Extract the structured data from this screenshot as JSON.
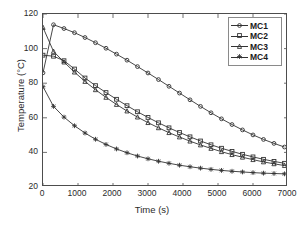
{
  "chart_data": {
    "type": "line",
    "title": "",
    "xlabel": "Time (s)",
    "ylabel": "Temperature (°C)",
    "xlim": [
      0,
      7000
    ],
    "ylim": [
      20,
      120
    ],
    "xticks": [
      0,
      1000,
      2000,
      3000,
      4000,
      5000,
      6000,
      7000
    ],
    "yticks": [
      20,
      40,
      60,
      80,
      100,
      120
    ],
    "xtick_labels": [
      "0",
      "1000",
      "2000",
      "3000",
      "4000",
      "5000",
      "6000",
      "7000"
    ],
    "ytick_labels": [
      "20",
      "40",
      "60",
      "80",
      "100",
      "120"
    ],
    "grid": false,
    "legend_position": "upper right",
    "line_color": "#333333",
    "series": [
      {
        "name": "MC1",
        "marker": "circle",
        "x": [
          0,
          300,
          600,
          900,
          1200,
          1500,
          1800,
          2100,
          2400,
          2700,
          3000,
          3300,
          3600,
          3900,
          4200,
          4500,
          4800,
          5100,
          5400,
          5700,
          6000,
          6300,
          6600,
          6900
        ],
        "y": [
          86.0,
          113.8,
          111.6,
          109.2,
          106.4,
          103.4,
          100.2,
          96.8,
          93.3,
          89.6,
          85.9,
          82.1,
          78.2,
          74.3,
          70.4,
          66.6,
          62.9,
          59.4,
          56.1,
          53.0,
          50.1,
          47.5,
          45.2,
          43.1
        ]
      },
      {
        "name": "MC2",
        "marker": "square",
        "x": [
          0,
          300,
          600,
          900,
          1200,
          1500,
          1800,
          2100,
          2400,
          2700,
          3000,
          3300,
          3600,
          3900,
          4200,
          4500,
          4800,
          5100,
          5400,
          5700,
          6000,
          6300,
          6600,
          6900
        ],
        "y": [
          96.2,
          95.6,
          93.0,
          88.2,
          83.0,
          78.6,
          74.6,
          70.7,
          67.0,
          63.5,
          60.2,
          57.1,
          54.2,
          51.5,
          49.0,
          46.6,
          44.4,
          42.4,
          40.6,
          38.9,
          37.4,
          36.0,
          34.8,
          33.7
        ]
      },
      {
        "name": "MC3",
        "marker": "triangle",
        "x": [
          0,
          300,
          600,
          900,
          1200,
          1500,
          1800,
          2100,
          2400,
          2700,
          3000,
          3300,
          3600,
          3900,
          4200,
          4500,
          4800,
          5100,
          5400,
          5700,
          6000,
          6300,
          6600,
          6900
        ],
        "y": [
          112.2,
          98.4,
          92.2,
          86.4,
          81.0,
          76.2,
          71.8,
          67.7,
          63.9,
          60.4,
          57.2,
          54.2,
          51.4,
          48.9,
          46.5,
          44.3,
          42.3,
          40.4,
          38.7,
          37.2,
          35.8,
          34.5,
          33.4,
          32.4
        ]
      },
      {
        "name": "MC4",
        "marker": "star",
        "x": [
          0,
          300,
          600,
          900,
          1200,
          1500,
          1800,
          2100,
          2400,
          2700,
          3000,
          3300,
          3600,
          3900,
          4200,
          4500,
          4800,
          5100,
          5400,
          5700,
          6000,
          6300,
          6600,
          6900
        ],
        "y": [
          78.0,
          66.6,
          60.4,
          55.4,
          51.2,
          47.6,
          44.6,
          42.0,
          39.8,
          37.9,
          36.3,
          34.9,
          33.7,
          32.6,
          31.7,
          30.9,
          30.2,
          29.6,
          29.1,
          28.7,
          28.3,
          28.0,
          27.8,
          27.6
        ]
      }
    ]
  },
  "legend": {
    "entries": [
      {
        "label": "MC1"
      },
      {
        "label": "MC2"
      },
      {
        "label": "MC3"
      },
      {
        "label": "MC4"
      }
    ]
  }
}
